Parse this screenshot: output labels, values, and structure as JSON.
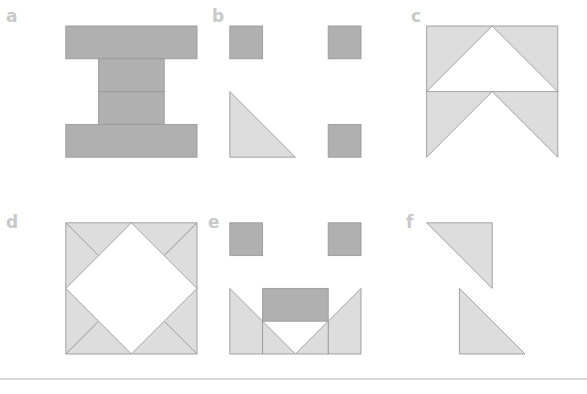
{
  "figure": {
    "title": "",
    "width": 587,
    "height": 394,
    "background": "#ffffff",
    "grid": {
      "line_color": "#8e8e8e",
      "line_width": 1.1,
      "cell_size": 32.8,
      "origin_x": 33.0,
      "origin_y": 26.0,
      "cols": 17,
      "rows": 11
    },
    "colors": {
      "fill_dark": "#b0b0b0",
      "fill_light": "#dddddd",
      "shape_edge": "#9a9a9a",
      "label": "#c9c9c9",
      "baseline_rule": "#d8d8d8"
    },
    "baseline_rule": {
      "y": 379,
      "x1": 0,
      "x2": 587,
      "thickness": 2
    }
  },
  "panels": [
    {
      "id": "a",
      "label": "a",
      "label_x": 6,
      "label_y": 22,
      "origin_col": 1,
      "origin_row": 0,
      "cols": 5,
      "rows": 5,
      "description": "Solid I-shape / H-shape of dark squares",
      "shapes": [
        {
          "name": "top-bar",
          "type": "rect",
          "fill": "fill_dark",
          "col": 0,
          "row": 0,
          "w": 4,
          "h": 1
        },
        {
          "name": "stem-upper",
          "type": "rect",
          "fill": "fill_dark",
          "col": 1,
          "row": 1,
          "w": 2,
          "h": 1
        },
        {
          "name": "stem-lower",
          "type": "rect",
          "fill": "fill_dark",
          "col": 1,
          "row": 2,
          "w": 2,
          "h": 1
        },
        {
          "name": "bottom-bar",
          "type": "rect",
          "fill": "fill_dark",
          "col": 0,
          "row": 3,
          "w": 4,
          "h": 1
        }
      ]
    },
    {
      "id": "b",
      "label": "b",
      "label_x": 212,
      "label_y": 22,
      "origin_col": 6,
      "origin_row": 0,
      "cols": 5,
      "rows": 5,
      "description": "Three isolated dark squares and one light right triangle",
      "shapes": [
        {
          "name": "square-top-left",
          "type": "rect",
          "fill": "fill_dark",
          "col": 0,
          "row": 0,
          "w": 1,
          "h": 1
        },
        {
          "name": "square-top-right",
          "type": "rect",
          "fill": "fill_dark",
          "col": 3,
          "row": 0,
          "w": 1,
          "h": 1
        },
        {
          "name": "square-mid-right",
          "type": "rect",
          "fill": "fill_dark",
          "col": 3,
          "row": 3,
          "w": 1,
          "h": 1
        },
        {
          "name": "triangle-diagonal",
          "type": "poly",
          "fill": "fill_light",
          "points": [
            [
              0,
              2
            ],
            [
              0,
              4
            ],
            [
              2,
              4
            ]
          ]
        }
      ]
    },
    {
      "id": "c",
      "label": "c",
      "label_x": 411,
      "label_y": 22,
      "origin_col": 12,
      "origin_row": 0,
      "cols": 5,
      "rows": 5,
      "description": "Two stacked light chevrons (inverted-V arrows)",
      "shapes": [
        {
          "name": "chevron-upper",
          "type": "poly",
          "fill": "fill_light",
          "points": [
            [
              0,
              0
            ],
            [
              4,
              0
            ],
            [
              4,
              2
            ],
            [
              2,
              0
            ],
            [
              0,
              2
            ]
          ]
        },
        {
          "name": "chevron-lower",
          "type": "poly",
          "fill": "fill_light",
          "points": [
            [
              0,
              2
            ],
            [
              4,
              2
            ],
            [
              4,
              4
            ],
            [
              2,
              2
            ],
            [
              0,
              4
            ]
          ]
        }
      ]
    },
    {
      "id": "d",
      "label": "d",
      "label_x": 6,
      "label_y": 228,
      "origin_col": 1,
      "origin_row": 6,
      "cols": 5,
      "rows": 5,
      "description": "Light square frame with an inscribed diamond cut out (eight corner triangles)",
      "shapes": [
        {
          "name": "corner-top-left-a",
          "type": "poly",
          "fill": "fill_light",
          "points": [
            [
              0,
              0
            ],
            [
              2,
              0
            ],
            [
              1,
              1
            ]
          ]
        },
        {
          "name": "corner-top-left-b",
          "type": "poly",
          "fill": "fill_light",
          "points": [
            [
              0,
              0
            ],
            [
              1,
              1
            ],
            [
              0,
              2
            ]
          ]
        },
        {
          "name": "corner-top-right-a",
          "type": "poly",
          "fill": "fill_light",
          "points": [
            [
              2,
              0
            ],
            [
              4,
              0
            ],
            [
              3,
              1
            ]
          ]
        },
        {
          "name": "corner-top-right-b",
          "type": "poly",
          "fill": "fill_light",
          "points": [
            [
              4,
              0
            ],
            [
              4,
              2
            ],
            [
              3,
              1
            ]
          ]
        },
        {
          "name": "corner-bottom-right-a",
          "type": "poly",
          "fill": "fill_light",
          "points": [
            [
              4,
              2
            ],
            [
              4,
              4
            ],
            [
              3,
              3
            ]
          ]
        },
        {
          "name": "corner-bottom-right-b",
          "type": "poly",
          "fill": "fill_light",
          "points": [
            [
              4,
              4
            ],
            [
              2,
              4
            ],
            [
              3,
              3
            ]
          ]
        },
        {
          "name": "corner-bottom-left-a",
          "type": "poly",
          "fill": "fill_light",
          "points": [
            [
              2,
              4
            ],
            [
              0,
              4
            ],
            [
              1,
              3
            ]
          ]
        },
        {
          "name": "corner-bottom-left-b",
          "type": "poly",
          "fill": "fill_light",
          "points": [
            [
              0,
              4
            ],
            [
              0,
              2
            ],
            [
              1,
              3
            ]
          ]
        }
      ]
    },
    {
      "id": "e",
      "label": "e",
      "label_x": 208,
      "label_y": 228,
      "origin_col": 6,
      "origin_row": 6,
      "cols": 5,
      "rows": 5,
      "description": "Smiling face: two dark square eyes, dark mouth bar and light V-shaped smile",
      "shapes": [
        {
          "name": "eye-left",
          "type": "rect",
          "fill": "fill_dark",
          "col": 0,
          "row": 0,
          "w": 1,
          "h": 1
        },
        {
          "name": "eye-right",
          "type": "rect",
          "fill": "fill_dark",
          "col": 3,
          "row": 0,
          "w": 1,
          "h": 1
        },
        {
          "name": "mouth-bar",
          "type": "rect",
          "fill": "fill_dark",
          "col": 1,
          "row": 2,
          "w": 2,
          "h": 1
        },
        {
          "name": "smile-left",
          "type": "poly",
          "fill": "fill_light",
          "points": [
            [
              0,
              2
            ],
            [
              1,
              3
            ],
            [
              1,
              4
            ],
            [
              0,
              4
            ]
          ]
        },
        {
          "name": "smile-right",
          "type": "poly",
          "fill": "fill_light",
          "points": [
            [
              4,
              2
            ],
            [
              4,
              4
            ],
            [
              3,
              4
            ],
            [
              3,
              3
            ]
          ]
        },
        {
          "name": "smile-chin-left",
          "type": "poly",
          "fill": "fill_light",
          "points": [
            [
              1,
              3
            ],
            [
              2,
              4
            ],
            [
              1,
              4
            ]
          ]
        },
        {
          "name": "smile-chin-right",
          "type": "poly",
          "fill": "fill_light",
          "points": [
            [
              3,
              3
            ],
            [
              3,
              4
            ],
            [
              2,
              4
            ]
          ]
        }
      ]
    },
    {
      "id": "f",
      "label": "f",
      "label_x": 406,
      "label_y": 228,
      "origin_col": 12,
      "origin_row": 6,
      "cols": 5,
      "rows": 5,
      "description": "Two offset light right triangles forming a broken diagonal",
      "shapes": [
        {
          "name": "triangle-upper",
          "type": "poly",
          "fill": "fill_light",
          "points": [
            [
              0,
              0
            ],
            [
              2,
              0
            ],
            [
              2,
              2
            ]
          ]
        },
        {
          "name": "triangle-lower",
          "type": "poly",
          "fill": "fill_light",
          "points": [
            [
              1,
              2
            ],
            [
              3,
              4
            ],
            [
              1,
              4
            ]
          ]
        }
      ]
    }
  ]
}
